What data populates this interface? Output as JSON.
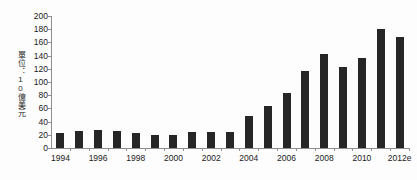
{
  "chart_data": {
    "type": "bar",
    "title": "",
    "subtitle": "",
    "xlabel": "",
    "ylabel": "單位：10億美元",
    "ylim": [
      0,
      200
    ],
    "ytick_step": 20,
    "ytick_labels": [
      "200",
      "180",
      "160",
      "140",
      "120",
      "100",
      "80",
      "60",
      "40",
      "20",
      "0"
    ],
    "ytick_values": [
      200,
      180,
      160,
      140,
      120,
      100,
      80,
      60,
      40,
      20,
      0
    ],
    "grid": false,
    "legend": false,
    "legend_position": "none",
    "bar_color": "#262626",
    "axis_color": "#8e8e8e",
    "categories": [
      "1994",
      "1995",
      "1996",
      "1997",
      "1998",
      "1999",
      "2000",
      "2001",
      "2002",
      "2003",
      "2004",
      "2005",
      "2006",
      "2007",
      "2008",
      "2009",
      "2010",
      "2011",
      "2012e"
    ],
    "values": [
      22,
      26,
      27,
      26,
      23,
      19,
      20,
      24,
      25,
      25,
      49,
      64,
      83,
      116,
      143,
      122,
      137,
      180,
      168
    ],
    "xtick_labels": [
      "1994",
      "1996",
      "1998",
      "2000",
      "2002",
      "2004",
      "2006",
      "2008",
      "2010",
      "2012e"
    ],
    "xtick_label_indices": [
      0,
      2,
      4,
      6,
      8,
      10,
      12,
      14,
      16,
      18
    ]
  }
}
